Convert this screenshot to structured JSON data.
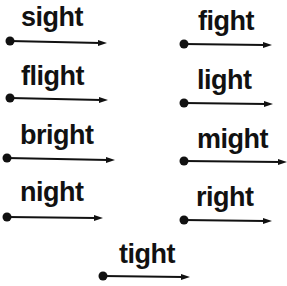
{
  "worksheet": {
    "words": [
      {
        "id": "sight",
        "text": "sight"
      },
      {
        "id": "fight",
        "text": "fight"
      },
      {
        "id": "flight",
        "text": "flight"
      },
      {
        "id": "light",
        "text": "light"
      },
      {
        "id": "bright",
        "text": "bright"
      },
      {
        "id": "might",
        "text": "might"
      },
      {
        "id": "night",
        "text": "night"
      },
      {
        "id": "right",
        "text": "right"
      },
      {
        "id": "tight",
        "text": "tight"
      }
    ]
  },
  "colors": {
    "ink": "#111111",
    "background": "#ffffff"
  }
}
